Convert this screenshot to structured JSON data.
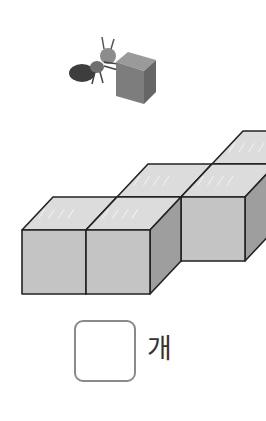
{
  "problem": {
    "illustration": "ant-pushing-cube",
    "figure": "stacked-unit-cubes",
    "answer_value": "",
    "unit_label": "개"
  },
  "colors": {
    "cube_top": "#dcdcdc",
    "cube_front": "#c4c4c4",
    "cube_side": "#9e9e9e",
    "edge": "#222222",
    "ant_body": "#3d3d3d",
    "ant_head": "#8c8c8c",
    "answer_border": "#8a8a8a"
  }
}
